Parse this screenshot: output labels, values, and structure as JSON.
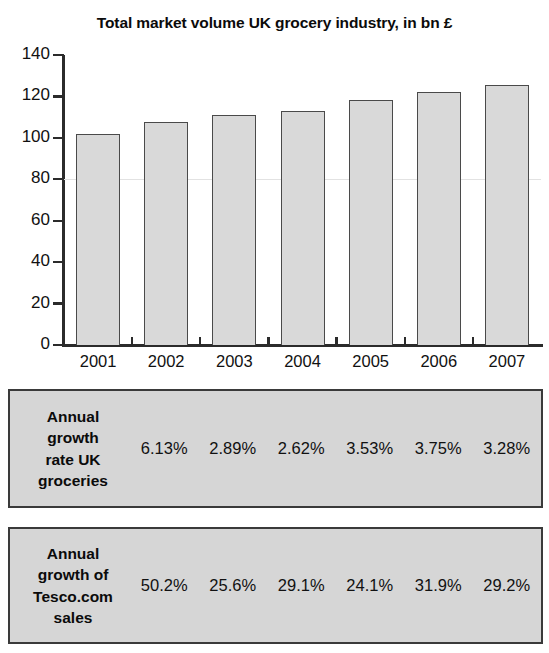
{
  "chart_data": {
    "type": "bar",
    "title": "Total market volume UK grocery industry, in bn £",
    "xlabel": "",
    "ylabel": "",
    "categories": [
      "2001",
      "2002",
      "2003",
      "2004",
      "2005",
      "2006",
      "2007"
    ],
    "values": [
      102,
      107.5,
      111,
      113,
      118.5,
      122,
      125.5
    ],
    "ylim": [
      0,
      140
    ],
    "ytick_labels": [
      "140",
      "120",
      "100",
      "80",
      "60",
      "40",
      "20",
      "0"
    ],
    "yticks": [
      140,
      120,
      100,
      80,
      60,
      40,
      20,
      0
    ],
    "grid": "single faint horizontal line at 80",
    "legend": "none",
    "bar_fill_color": "#d9d9d9",
    "bar_edge_color": "#4a4a4a",
    "axis_color": "#2b2b2b"
  },
  "title": "Total market volume UK grocery industry, in bn £",
  "panels": [
    {
      "name": "annual-growth-rate-uk-groceries",
      "label": "Annual growth rate UK groceries",
      "label_lines": [
        "Annual",
        "growth",
        "rate UK",
        "groceries"
      ],
      "values": [
        "6.13%",
        "2.89%",
        "2.62%",
        "3.53%",
        "3.75%",
        "3.28%"
      ],
      "background_color": "#d6d6d6",
      "border_color": "#3a3a3a"
    },
    {
      "name": "annual-growth-of-tesco-com-sales",
      "label": "Annual growth of Tesco.com sales",
      "label_lines": [
        "Annual",
        "growth of",
        "Tesco.com",
        "sales"
      ],
      "values": [
        "50.2%",
        "25.6%",
        "29.1%",
        "24.1%",
        "31.9%",
        "29.2%"
      ],
      "background_color": "#d6d6d6",
      "border_color": "#3a3a3a"
    }
  ]
}
